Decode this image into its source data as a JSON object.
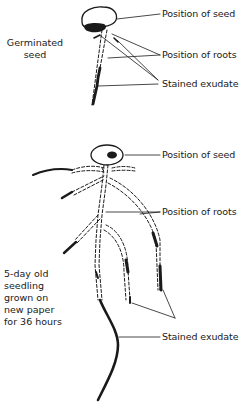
{
  "panel_top": {
    "caption": [
      "Germinated",
      "seed"
    ],
    "labels": {
      "seed": "Position of seed",
      "roots": "Position of roots",
      "exudate": "Stained exudate"
    }
  },
  "panel_bottom": {
    "caption": [
      "5-day old",
      "seedling",
      "grown on",
      "new paper",
      "for 36 hours"
    ],
    "labels": {
      "seed": "Position of seed",
      "roots": "Position of roots",
      "exudate": "Stained exudate"
    }
  },
  "colors": {
    "ink": "#1a1a1a",
    "background": "#ffffff"
  }
}
